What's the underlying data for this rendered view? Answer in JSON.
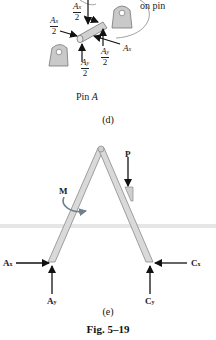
{
  "figure_d": {
    "annotation": "on pin",
    "forces": {
      "ax_half_top": {
        "num": "A",
        "sub": "x",
        "den": "2"
      },
      "ax_half_left": {
        "num": "A",
        "sub": "x",
        "den": "2"
      },
      "ax": {
        "label": "A",
        "sub": "x"
      },
      "ay_half_right": {
        "num": "A",
        "sub": "y",
        "den": "2"
      },
      "ay_half_bottom": {
        "num": "A",
        "sub": "y",
        "den": "2"
      }
    },
    "title": "Pin",
    "title_var": "A",
    "caption": "(d)"
  },
  "figure_e": {
    "labels": {
      "P": "P",
      "M": "M",
      "Ax": {
        "main": "A",
        "sub": "x"
      },
      "Ay": {
        "main": "A",
        "sub": "y"
      },
      "Cx": {
        "main": "C",
        "sub": "x"
      },
      "Cy": {
        "main": "C",
        "sub": "y"
      }
    },
    "caption": "(e)"
  },
  "figure_caption": "Fig. 5–19",
  "colors": {
    "member_fill": "#d9d9d9",
    "member_stroke": "#8a8a8a",
    "arrow": "#111111",
    "moment_arrow": "#6e7f8e",
    "bracket_fill": "#c9c9c9",
    "page_shadow": "#e4e4e4"
  }
}
